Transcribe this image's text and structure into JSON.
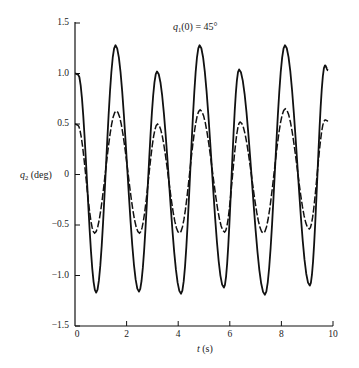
{
  "chart_data": {
    "type": "line",
    "title": "",
    "annotation": {
      "var": "q",
      "sub": "1",
      "rest": "(0) = 45°"
    },
    "xlabel": {
      "var": "t",
      "rest": " (s)"
    },
    "ylabel": {
      "var": "q",
      "sub": "2",
      "rest": " (deg)"
    },
    "xlim": [
      0,
      10
    ],
    "ylim": [
      -1.5,
      1.5
    ],
    "grid": false,
    "legend": "none",
    "x_ticks": [
      0,
      2,
      4,
      6,
      8,
      10
    ],
    "x_tick_labels": [
      "0",
      "2",
      "4",
      "6",
      "8",
      "10"
    ],
    "y_ticks": [
      1.5,
      1.0,
      0.5,
      0,
      -0.5,
      -1.0,
      -1.5
    ],
    "y_tick_labels": [
      "1.5",
      "1.0",
      "0.5",
      "0",
      "−0.5",
      "−1.0",
      "−1.5"
    ],
    "series": [
      {
        "name": "solid",
        "style": "solid",
        "color": "#111111",
        "extrema_t": [
          0,
          0.12,
          0.82,
          1.57,
          2.48,
          3.18,
          4.11,
          4.83,
          5.77,
          6.36,
          7.36,
          8.14,
          9.1,
          9.69,
          9.81
        ],
        "extrema_v": [
          1.0,
          0.99,
          -1.17,
          1.28,
          -1.16,
          1.02,
          -1.18,
          1.28,
          -1.12,
          1.04,
          -1.19,
          1.28,
          -1.1,
          1.08,
          1.03
        ]
      },
      {
        "name": "dashed",
        "style": "dashed",
        "color": "#111111",
        "extrema_t": [
          0,
          0.1,
          0.76,
          1.6,
          2.5,
          3.2,
          4.05,
          4.85,
          5.8,
          6.4,
          7.3,
          8.15,
          9.08,
          9.69,
          9.81
        ],
        "extrema_v": [
          0.5,
          0.49,
          -0.58,
          0.63,
          -0.58,
          0.5,
          -0.58,
          0.64,
          -0.57,
          0.52,
          -0.58,
          0.65,
          -0.54,
          0.54,
          0.53
        ]
      }
    ]
  }
}
